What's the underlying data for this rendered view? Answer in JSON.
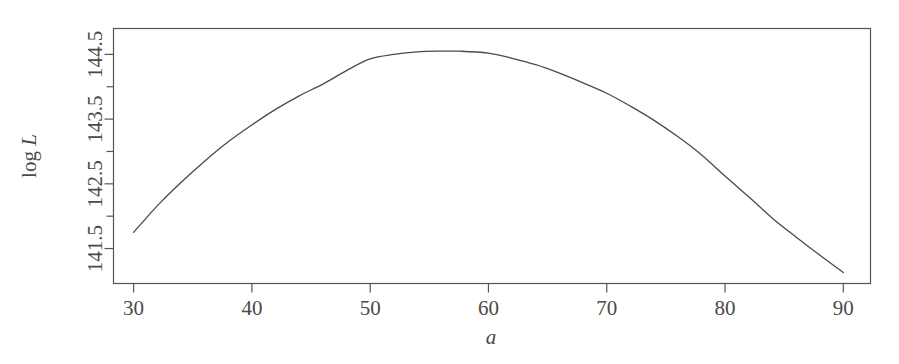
{
  "figure": {
    "background_color": "#ffffff",
    "line_color": "#4a4a4a",
    "axis_color": "#555555"
  },
  "chart_data": {
    "type": "line",
    "title": "",
    "subtitle": "",
    "xlabel": "a",
    "ylabel": "log L",
    "ylabel_parts": {
      "prefix": "log",
      "symbol": "L"
    },
    "xlim": [
      28.3,
      92.3
    ],
    "ylim": [
      140.96,
      144.9
    ],
    "grid": false,
    "legend": null,
    "x_ticks_major": [
      30,
      40,
      50,
      60,
      70,
      80,
      90
    ],
    "x_tick_labels": [
      "30",
      "40",
      "50",
      "60",
      "70",
      "80",
      "90"
    ],
    "y_ticks_major": [
      141.5,
      142.5,
      143.5,
      144.5
    ],
    "y_tick_labels": [
      "141.5",
      "142.5",
      "143.5",
      "144.5"
    ],
    "y_ticks_minor": [
      142.0,
      143.0,
      144.0
    ],
    "y_tick_label_rotation": -90,
    "series": [
      {
        "name": "profile log-likelihood",
        "x": [
          30,
          32,
          34,
          36,
          38,
          40,
          42,
          44,
          46,
          48,
          50,
          52,
          54,
          56,
          57.5,
          58,
          60,
          62,
          64,
          66,
          68,
          70,
          72,
          74,
          76,
          78,
          80,
          82,
          84,
          86,
          88,
          90
        ],
        "y": [
          141.75,
          142.16,
          142.52,
          142.85,
          143.15,
          143.41,
          143.65,
          143.86,
          144.04,
          144.25,
          144.43,
          144.5,
          144.54,
          144.55,
          144.55,
          144.545,
          144.52,
          144.44,
          144.34,
          144.21,
          144.06,
          143.9,
          143.7,
          143.48,
          143.23,
          142.95,
          142.62,
          142.3,
          141.97,
          141.68,
          141.4,
          141.13
        ]
      }
    ],
    "annotations": []
  }
}
